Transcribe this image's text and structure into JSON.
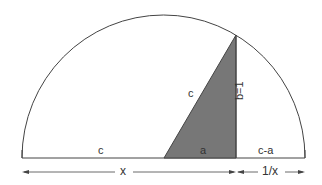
{
  "diagram": {
    "colors": {
      "line": "#444444",
      "fill": "#777777",
      "background": "#ffffff"
    },
    "labels": {
      "hypotenuse": "c",
      "left_segment": "c",
      "triangle_base": "a",
      "right_segment": "c-a",
      "height": "b=1",
      "arrow_x": "x",
      "arrow_inv_x": "1/x"
    }
  }
}
